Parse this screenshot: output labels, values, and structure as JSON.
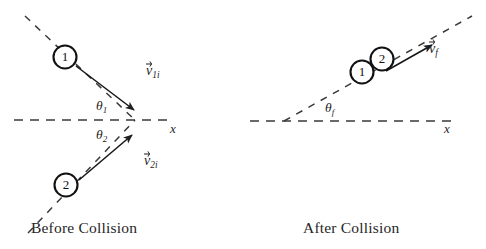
{
  "figure": {
    "background_color": "#ffffff",
    "ink_color": "#1f1f1f"
  },
  "panels": [
    {
      "id": "before",
      "caption": "Before Collision",
      "axis_label": "x",
      "particles": [
        {
          "id": "1",
          "label": "1"
        },
        {
          "id": "2",
          "label": "2"
        }
      ],
      "vectors": [
        {
          "id": "v1i",
          "symbol": "v",
          "subscript": "1i",
          "accent": "arrow"
        },
        {
          "id": "v2i",
          "symbol": "v",
          "subscript": "2i",
          "accent": "arrow"
        }
      ],
      "angles": [
        {
          "id": "theta1",
          "symbol": "θ",
          "subscript": "1"
        },
        {
          "id": "theta2",
          "symbol": "θ",
          "subscript": "2"
        }
      ]
    },
    {
      "id": "after",
      "caption": "After Collision",
      "axis_label": "x",
      "particles": [
        {
          "id": "1",
          "label": "1"
        },
        {
          "id": "2",
          "label": "2"
        }
      ],
      "vectors": [
        {
          "id": "vf",
          "symbol": "v",
          "subscript": "f",
          "accent": "arrow"
        }
      ],
      "angles": [
        {
          "id": "thetaf",
          "symbol": "θ",
          "subscript": "f"
        }
      ]
    }
  ],
  "labels": {
    "caption_before": "Before Collision",
    "caption_after": "After Collision",
    "v_symbol": "v",
    "theta_symbol": "θ",
    "sub_1i": "1i",
    "sub_2i": "2i",
    "sub_f": "f",
    "sub_1": "1",
    "sub_2": "2",
    "axis_x": "x",
    "particle_1": "1",
    "particle_2": "2"
  }
}
